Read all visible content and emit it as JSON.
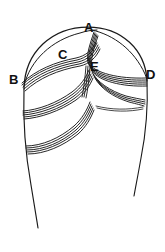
{
  "figure": {
    "kind": "anatomical-line-diagram",
    "background_color": "#ffffff",
    "stroke_color": "#1a1a1a",
    "label_color": "#111111",
    "width_px": 165,
    "height_px": 252,
    "labels": [
      {
        "id": "A",
        "text": "A",
        "x": 88,
        "y": 28
      },
      {
        "id": "B",
        "text": "B",
        "x": 14,
        "y": 81
      },
      {
        "id": "C",
        "text": "C",
        "x": 63,
        "y": 56
      },
      {
        "id": "D",
        "text": "D",
        "x": 151,
        "y": 76
      },
      {
        "id": "E",
        "text": "E",
        "x": 95,
        "y": 68
      }
    ],
    "structures": [
      {
        "name": "cranial-outline",
        "description": "large ovoid head outline, open at the bottom with two tapering lines"
      },
      {
        "name": "suture-band-left-upper",
        "description": "multi-stroke curved band from B up through C toward A"
      },
      {
        "name": "suture-band-right-upper",
        "description": "multi-stroke curved band from A through E toward D"
      },
      {
        "name": "suture-band-left-mid",
        "description": "multi-stroke curved band crossing the left mid region"
      },
      {
        "name": "suture-band-right-mid",
        "description": "multi-stroke curved band crossing the right mid region"
      },
      {
        "name": "suture-band-lower",
        "description": "multi-stroke curved band across the lower left region"
      },
      {
        "name": "suture-band-vertical",
        "description": "multi-stroke band descending from the C/E junction"
      }
    ]
  }
}
